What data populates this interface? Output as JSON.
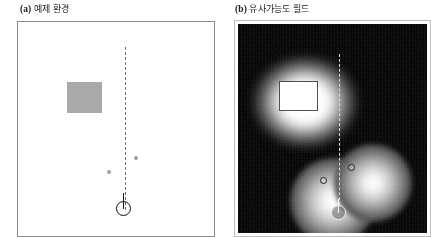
{
  "figure": {
    "panel_a": {
      "caption_tag": "(a)",
      "caption_text": "예제 환경",
      "elements": {
        "obstacle_label": "rectangular-obstacle",
        "obstacle_fill": "#a9a9a9",
        "landmark_count": 2,
        "landmark_fill": "#a0a0a0",
        "beam_style": "dashed",
        "beam_color": "#6e6e6e",
        "robot_marker": "circle-with-heading-line",
        "robot_color": "#111111",
        "background": "#ffffff",
        "border_color": "#8b8b8b"
      }
    },
    "panel_b": {
      "caption_tag": "(b)",
      "caption_text": "유사가능도 필드",
      "elements": {
        "field_background": "#050505",
        "glow_peak_color": "#ffffff",
        "obstacle_label": "rectangular-obstacle",
        "obstacle_fill": "#ffffff",
        "obstacle_stroke": "#4a4a4a",
        "landmark_count": 2,
        "landmark_stroke": "#1c1c1c",
        "beam_style": "dashed",
        "beam_color": "#d8d8d8",
        "robot_marker": "circle-with-heading-line",
        "robot_color": "#f2f2f2",
        "border_color": "#bdbdbd"
      }
    }
  },
  "chart_data": {
    "type": "heatmap",
    "title": "",
    "subtitle": "",
    "xlabel": "",
    "ylabel": "",
    "grid": false,
    "legend": "none",
    "panels": [
      {
        "id": "a",
        "label": "(a) 예제 환경",
        "description": "Occupancy map with one rectangular obstacle, two point landmarks, a dashed sensor beam and a robot pose marker.",
        "xlim": [
          0,
          100
        ],
        "ylim": [
          0,
          100
        ],
        "objects": [
          {
            "name": "rectangular-obstacle",
            "shape": "rect",
            "x": 25,
            "y": 58,
            "width": 18,
            "height": 14,
            "fill": "#a9a9a9"
          },
          {
            "name": "landmark-1",
            "shape": "point",
            "x": 59,
            "y": 38,
            "radius": 1.0,
            "fill": "#a0a0a0"
          },
          {
            "name": "landmark-2",
            "shape": "point",
            "x": 45,
            "y": 31,
            "radius": 1.0,
            "fill": "#a0a0a0"
          },
          {
            "name": "sensor-beam",
            "shape": "dashed-line",
            "x": 54,
            "y_start": 88,
            "y_end": 13,
            "color": "#6e6e6e"
          },
          {
            "name": "robot-pose",
            "shape": "circle-with-heading",
            "x": 54,
            "y": 9,
            "radius": 3.8,
            "heading_deg": 90,
            "color": "#111111"
          }
        ]
      },
      {
        "id": "b",
        "label": "(b) 유사가능도 필드",
        "description": "Likelihood field for the same map: brightness encodes measurement likelihood, peaking on obstacle surfaces and landmarks and decaying with distance.",
        "xlim": [
          0,
          100
        ],
        "ylim": [
          0,
          100
        ],
        "colormap": "gray",
        "value_range": [
          0,
          1
        ],
        "value_low_color": "#050505",
        "value_high_color": "#ffffff",
        "blobs": [
          {
            "name": "obstacle-likelihood-blob",
            "center_x": 34,
            "center_y": 63,
            "peak_value": 1.0,
            "sigma_x": 22,
            "sigma_y": 20,
            "shape": "rounded-rect"
          },
          {
            "name": "landmark-1-likelihood-blob",
            "center_x": 70,
            "center_y": 25,
            "peak_value": 1.0,
            "sigma_x": 14,
            "sigma_y": 14,
            "shape": "circle"
          },
          {
            "name": "landmark-2-likelihood-blob",
            "center_x": 48,
            "center_y": 18,
            "peak_value": 1.0,
            "sigma_x": 15,
            "sigma_y": 15,
            "shape": "circle"
          }
        ],
        "objects": [
          {
            "name": "rectangular-obstacle",
            "shape": "rect",
            "x": 21,
            "y": 58,
            "width": 20,
            "height": 14,
            "fill": "#ffffff",
            "stroke": "#4a4a4a"
          },
          {
            "name": "landmark-1",
            "shape": "ring",
            "x": 57,
            "y": 31,
            "radius": 1.8,
            "stroke": "#1c1c1c"
          },
          {
            "name": "landmark-2",
            "shape": "ring",
            "x": 43,
            "y": 25,
            "radius": 1.8,
            "stroke": "#1c1c1c"
          },
          {
            "name": "sensor-beam",
            "shape": "dashed-line",
            "x": 52,
            "y_start": 86,
            "y_end": 9,
            "color": "#d8d8d8"
          },
          {
            "name": "robot-pose",
            "shape": "circle-with-heading",
            "x": 52,
            "y": 8,
            "radius": 3.8,
            "heading_deg": 90,
            "color": "#f2f2f2"
          }
        ]
      }
    ]
  }
}
